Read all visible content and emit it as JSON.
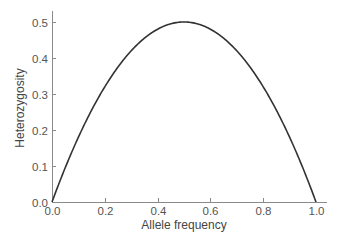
{
  "chart_data": {
    "type": "line",
    "title": "",
    "xlabel": "Allele frequency",
    "ylabel": "Heterozygosity",
    "xlim": [
      0.0,
      1.0
    ],
    "ylim": [
      0.0,
      0.5
    ],
    "x_ticks": [
      "0.0",
      "0.2",
      "0.4",
      "0.6",
      "0.8",
      "1.0"
    ],
    "y_ticks": [
      "0.0",
      "0.1",
      "0.2",
      "0.3",
      "0.4",
      "0.5"
    ],
    "grid": false,
    "legend": null,
    "series": [
      {
        "name": "Heterozygosity",
        "formula": "2p(1-p)",
        "x": [
          0.0,
          0.05,
          0.1,
          0.15,
          0.2,
          0.25,
          0.3,
          0.35,
          0.4,
          0.45,
          0.5,
          0.55,
          0.6,
          0.65,
          0.7,
          0.75,
          0.8,
          0.85,
          0.9,
          0.95,
          1.0
        ],
        "values": [
          0.0,
          0.095,
          0.18,
          0.255,
          0.32,
          0.375,
          0.42,
          0.455,
          0.48,
          0.495,
          0.5,
          0.495,
          0.48,
          0.455,
          0.42,
          0.375,
          0.32,
          0.255,
          0.18,
          0.095,
          0.0
        ]
      }
    ]
  },
  "colors": {
    "axis": "#8a8a8a",
    "curve": "#333333",
    "text": "#555555"
  }
}
